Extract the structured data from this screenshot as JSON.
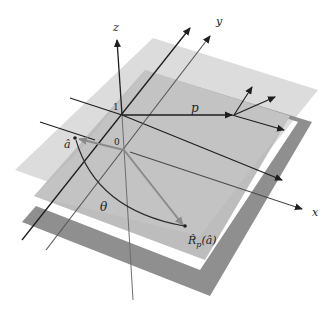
{
  "diagram": {
    "type": "3d-reflection-geometry",
    "labels": {
      "z_axis": "z",
      "y_axis": "y",
      "x_axis": "x",
      "p_vector": "p",
      "a_hat": "â",
      "theta": "θ",
      "reflected": "R̂",
      "reflected_sub": "p",
      "reflected_arg": "(â)",
      "upper_plane_height": "1",
      "lower_plane_height": "0"
    },
    "colors": {
      "upper_plane": "#d9d9d9",
      "lower_plane_face": "#bdbdbd",
      "lower_plane_edge": "#8e8e8e",
      "axis_line": "#1e1e1e",
      "vector_gray": "#8a8a8a"
    }
  }
}
